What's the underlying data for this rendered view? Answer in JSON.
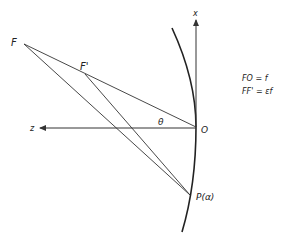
{
  "diagram": {
    "points": {
      "F": {
        "label": "F",
        "x": 24,
        "y": 44
      },
      "F_prime": {
        "label": "F'",
        "x": 85,
        "y": 74
      },
      "O": {
        "label": "O",
        "x": 196,
        "y": 127
      },
      "P": {
        "label": "P(α)",
        "x": 190,
        "y": 195
      }
    },
    "axes": {
      "x_label": "x",
      "z_label": "z"
    },
    "angle_label": "θ",
    "equations": [
      "FO = f",
      "FF' = εf"
    ],
    "colors": {
      "stroke": "#333333",
      "background": "#ffffff"
    }
  }
}
